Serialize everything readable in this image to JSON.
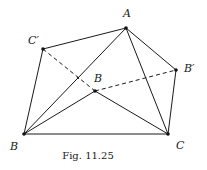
{
  "figure": {
    "caption": "Fig. 11.25",
    "colors": {
      "stroke": "#1a1a1a",
      "point": "#111111",
      "background": "#ffffff"
    },
    "points": [
      {
        "id": "A",
        "label": "A",
        "x": 126,
        "y": 28,
        "label_x": 123,
        "label_y": 17
      },
      {
        "id": "Cprime",
        "label": "C′",
        "x": 43,
        "y": 49,
        "label_x": 28,
        "label_y": 44
      },
      {
        "id": "Bprime",
        "label": "B′",
        "x": 176,
        "y": 70,
        "label_x": 184,
        "label_y": 72
      },
      {
        "id": "Binner",
        "label": "B",
        "x": 95,
        "y": 91,
        "label_x": 94,
        "label_y": 82
      },
      {
        "id": "B",
        "label": "B",
        "x": 24,
        "y": 134,
        "label_x": 10,
        "label_y": 150
      },
      {
        "id": "C",
        "label": "C",
        "x": 168,
        "y": 134,
        "label_x": 176,
        "label_y": 149
      },
      {
        "id": "X",
        "label": "",
        "x": 78,
        "y": 78,
        "label_x": 0,
        "label_y": 0
      }
    ],
    "solid_segments": [
      [
        "Cprime",
        "A"
      ],
      [
        "A",
        "Bprime"
      ],
      [
        "Cprime",
        "B"
      ],
      [
        "Bprime",
        "C"
      ],
      [
        "B",
        "C"
      ],
      [
        "B",
        "A"
      ],
      [
        "A",
        "C"
      ],
      [
        "B",
        "Binner"
      ],
      [
        "Binner",
        "C"
      ]
    ],
    "dashed_segments": [
      [
        "Cprime",
        "Binner"
      ],
      [
        "Binner",
        "Bprime"
      ]
    ]
  }
}
